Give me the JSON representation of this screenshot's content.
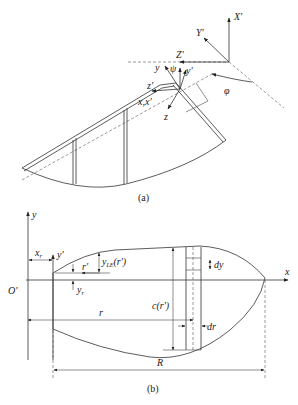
{
  "figure_a": {
    "caption": "(a)",
    "labels": {
      "X_prime": "X'",
      "Y_prime": "Y'",
      "Z_prime": "Z'",
      "y": "y",
      "psi": "ψ",
      "y_prime": "y'",
      "z_prime": "z'",
      "x_x_prime": "x,x'",
      "z": "z",
      "phi": "φ"
    }
  },
  "figure_b": {
    "caption": "(b)",
    "labels": {
      "y": "y",
      "x": "x",
      "origin": "O'",
      "x_r": "x",
      "x_r_sub": "r",
      "y_prime": "y'",
      "r_prime": "r'",
      "y_r": "y",
      "y_r_sub": "r",
      "y_le": "y",
      "y_le_sub": "LE",
      "y_le_arg": "(r')",
      "dy": "dy",
      "c_r": "c(r')",
      "r": "r",
      "dr": "dr",
      "R": "R"
    }
  }
}
